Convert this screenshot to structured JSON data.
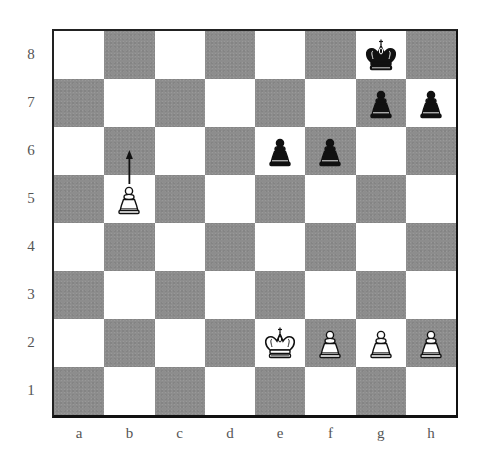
{
  "diagram": {
    "ranks": [
      "8",
      "7",
      "6",
      "5",
      "4",
      "3",
      "2",
      "1"
    ],
    "files": [
      "a",
      "b",
      "c",
      "d",
      "e",
      "f",
      "g",
      "h"
    ],
    "colors": {
      "light_square": "#ffffff",
      "dark_square": "#8d8d8d",
      "border": "#111111",
      "label": "#555555"
    },
    "pieces": [
      {
        "square": "g8",
        "piece": "king",
        "color": "black"
      },
      {
        "square": "g7",
        "piece": "pawn",
        "color": "black"
      },
      {
        "square": "h7",
        "piece": "pawn",
        "color": "black"
      },
      {
        "square": "e6",
        "piece": "pawn",
        "color": "black"
      },
      {
        "square": "f6",
        "piece": "pawn",
        "color": "black"
      },
      {
        "square": "b5",
        "piece": "pawn",
        "color": "white"
      },
      {
        "square": "e2",
        "piece": "king",
        "color": "white"
      },
      {
        "square": "f2",
        "piece": "pawn",
        "color": "white"
      },
      {
        "square": "g2",
        "piece": "pawn",
        "color": "white"
      },
      {
        "square": "h2",
        "piece": "pawn",
        "color": "white"
      }
    ],
    "arrows": [
      {
        "from": "b5",
        "to": "b6",
        "icon": "move-arrow-icon"
      }
    ]
  }
}
